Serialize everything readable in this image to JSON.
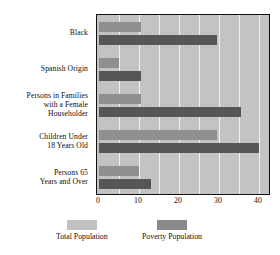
{
  "chart_data": {
    "type": "bar",
    "orientation": "horizontal",
    "title": "",
    "subtitle": "",
    "xlabel": "",
    "ylabel": "",
    "xlim": [
      0,
      44
    ],
    "xticks": [
      0,
      10,
      20,
      30,
      40
    ],
    "xtick_labels": [
      "0",
      "10",
      "20",
      "30",
      "40"
    ],
    "gridlines": [
      5,
      10,
      15,
      20,
      25,
      30,
      35,
      40
    ],
    "grid": true,
    "legend_position": "bottom",
    "categories": [
      "Black",
      "Spanish Origin",
      "Persons in Families with a Female Householder",
      "Children Under 18 Years Old",
      "Persons 65 Years and Over"
    ],
    "category_label_lines": [
      [
        "Black"
      ],
      [
        "Spanish Origin"
      ],
      [
        "Persons in Families",
        "with a Female",
        "Householder"
      ],
      [
        "Children Under",
        "18 Years Old"
      ],
      [
        "Persons 65",
        "Years and Over"
      ]
    ],
    "series": [
      {
        "name": "Total Population",
        "color": "#8f8f8f",
        "values": [
          10.5,
          5.0,
          10.5,
          29.5,
          10.0
        ]
      },
      {
        "name": "Poverty Population",
        "color": "#565656",
        "values": [
          29.5,
          10.5,
          35.5,
          40.0,
          13.0
        ]
      }
    ]
  },
  "legend": {
    "items": [
      {
        "label": "Total Population",
        "swatch": "total"
      },
      {
        "label": "Poverty Population",
        "swatch": "poverty"
      }
    ]
  },
  "colors": {
    "plot_background": "#c3c3c3",
    "frame": "#111111",
    "gridline": "#f2f2f2",
    "total_bar": "#8f8f8f",
    "poverty_bar": "#565656",
    "legend_total_swatch": "#c0c0c0",
    "legend_poverty_swatch": "#8a8a8a",
    "text": "#0d0d0d"
  }
}
